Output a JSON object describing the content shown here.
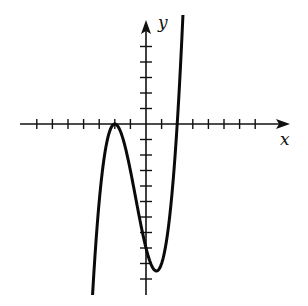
{
  "chart_data": {
    "type": "line",
    "title": "",
    "xlabel": "x",
    "ylabel": "y",
    "function": "f(x) = (x + 2)^2 (x - 2)",
    "xlim": [
      -8,
      9
    ],
    "ylim": [
      -11,
      6
    ],
    "x_ticks": [
      -7,
      -6,
      -5,
      -4,
      -3,
      -2,
      -1,
      1,
      2,
      3,
      4,
      5,
      6,
      7
    ],
    "y_ticks": [
      -10,
      -9,
      -8,
      -7,
      -6,
      -5,
      -4,
      -3,
      -2,
      -1,
      1,
      2,
      3,
      4,
      5
    ],
    "tick_labels_shown": false,
    "grid": false,
    "legend": null,
    "key_points": [
      {
        "name": "local maximum (double root)",
        "x": -2,
        "y": 0
      },
      {
        "name": "y-intercept",
        "x": 0,
        "y": -8
      },
      {
        "name": "local minimum",
        "x": 0.67,
        "y": -9.48
      },
      {
        "name": "root",
        "x": 2,
        "y": 0
      }
    ],
    "curve_domain": [
      -3.45,
      2.6
    ],
    "series": [
      {
        "name": "f(x)",
        "x": [
          -3.45,
          -3.0,
          -2.5,
          -2.0,
          -1.5,
          -1.0,
          -0.5,
          0.0,
          0.5,
          0.67,
          1.0,
          1.5,
          2.0,
          2.3,
          2.6
        ],
        "y": [
          -11.7,
          -5.0,
          -1.1,
          0.0,
          -0.9,
          -3.0,
          -5.6,
          -8.0,
          -9.4,
          -9.48,
          -9.0,
          -6.1,
          0.0,
          5.1,
          12.2
        ]
      }
    ],
    "colors": {
      "axis": "#111111",
      "curve": "#0a0a0a",
      "background": "#ffffff"
    }
  }
}
